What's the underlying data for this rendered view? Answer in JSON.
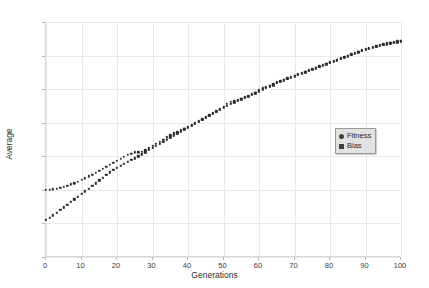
{
  "chart_data": {
    "type": "scatter",
    "title": "",
    "xlabel": "Generations",
    "ylabel": "Average",
    "xlim": [
      0,
      100
    ],
    "ylim": [
      0.4,
      0.75
    ],
    "grid": true,
    "legend_position": "center-right",
    "x_ticks": [
      "0",
      "10",
      "20",
      "30",
      "40",
      "50",
      "60",
      "70",
      "80",
      "90",
      "100"
    ],
    "x_tick_values": [
      0,
      10,
      20,
      30,
      40,
      50,
      60,
      70,
      80,
      90,
      100
    ],
    "y_ticks": [
      "0,40",
      "0,45",
      "0,50",
      "0,55",
      "0,60",
      "0,65",
      "0,70",
      "0,75"
    ],
    "y_tick_values": [
      0.4,
      0.45,
      0.5,
      0.55,
      0.6,
      0.65,
      0.7,
      0.75
    ],
    "marker_color": "#2b2b2b",
    "x": [
      0,
      1,
      2,
      3,
      4,
      5,
      6,
      7,
      8,
      9,
      10,
      11,
      12,
      13,
      14,
      15,
      16,
      17,
      18,
      19,
      20,
      21,
      22,
      23,
      24,
      25,
      26,
      27,
      28,
      29,
      30,
      31,
      32,
      33,
      34,
      35,
      36,
      37,
      38,
      39,
      40,
      41,
      42,
      43,
      44,
      45,
      46,
      47,
      48,
      49,
      50,
      51,
      52,
      53,
      54,
      55,
      56,
      57,
      58,
      59,
      60,
      61,
      62,
      63,
      64,
      65,
      66,
      67,
      68,
      69,
      70,
      71,
      72,
      73,
      74,
      75,
      76,
      77,
      78,
      79,
      80,
      81,
      82,
      83,
      84,
      85,
      86,
      87,
      88,
      89,
      90,
      91,
      92,
      93,
      94,
      95,
      96,
      97,
      98,
      99,
      100
    ],
    "series": [
      {
        "name": "Fitness",
        "marker": "circle",
        "values": [
          0.5,
          0.5,
          0.501,
          0.502,
          0.503,
          0.505,
          0.506,
          0.508,
          0.51,
          0.512,
          0.515,
          0.517,
          0.52,
          0.522,
          0.525,
          0.528,
          0.531,
          0.534,
          0.537,
          0.54,
          0.543,
          0.546,
          0.549,
          0.552,
          0.554,
          0.556,
          0.556,
          0.557,
          0.559,
          0.562,
          0.566,
          0.569,
          0.572,
          0.575,
          0.578,
          0.581,
          0.584,
          0.586,
          0.589,
          0.591,
          0.594,
          0.596,
          0.599,
          0.602,
          0.605,
          0.608,
          0.611,
          0.614,
          0.617,
          0.62,
          0.624,
          0.628,
          0.631,
          0.632,
          0.634,
          0.636,
          0.638,
          0.64,
          0.643,
          0.645,
          0.648,
          0.651,
          0.653,
          0.655,
          0.657,
          0.66,
          0.662,
          0.664,
          0.666,
          0.668,
          0.67,
          0.672,
          0.674,
          0.676,
          0.678,
          0.68,
          0.682,
          0.684,
          0.686,
          0.688,
          0.69,
          0.692,
          0.694,
          0.696,
          0.698,
          0.7,
          0.702,
          0.704,
          0.706,
          0.708,
          0.71,
          0.711,
          0.713,
          0.714,
          0.716,
          0.717,
          0.718,
          0.719,
          0.72,
          0.721,
          0.722
        ]
      },
      {
        "name": "Bias",
        "marker": "square",
        "values": [
          0.455,
          0.458,
          0.462,
          0.466,
          0.47,
          0.474,
          0.478,
          0.482,
          0.486,
          0.49,
          0.494,
          0.498,
          0.502,
          0.506,
          0.51,
          0.514,
          0.518,
          0.522,
          0.526,
          0.53,
          0.533,
          0.536,
          0.539,
          0.542,
          0.545,
          0.547,
          0.55,
          0.553,
          0.556,
          0.56,
          0.563,
          0.566,
          0.569,
          0.572,
          0.575,
          0.578,
          0.581,
          0.584,
          0.587,
          0.59,
          0.592,
          0.595,
          0.598,
          0.601,
          0.604,
          0.607,
          0.61,
          0.613,
          0.616,
          0.619,
          0.622,
          0.625,
          0.628,
          0.63,
          0.633,
          0.635,
          0.637,
          0.639,
          0.642,
          0.644,
          0.647,
          0.65,
          0.652,
          0.654,
          0.656,
          0.659,
          0.661,
          0.663,
          0.665,
          0.667,
          0.669,
          0.671,
          0.673,
          0.675,
          0.677,
          0.679,
          0.681,
          0.683,
          0.685,
          0.687,
          0.689,
          0.691,
          0.693,
          0.695,
          0.697,
          0.699,
          0.701,
          0.703,
          0.705,
          0.707,
          0.709,
          0.71,
          0.712,
          0.713,
          0.715,
          0.716,
          0.717,
          0.718,
          0.719,
          0.72,
          0.721
        ]
      }
    ]
  },
  "legend": {
    "items": [
      {
        "label": "Fitness",
        "marker": "circle"
      },
      {
        "label": "Bias",
        "marker": "square"
      }
    ]
  }
}
